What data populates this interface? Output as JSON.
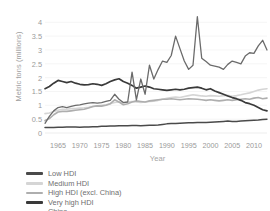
{
  "chart_data": {
    "type": "line",
    "title": "",
    "xlabel": "Year",
    "ylabel": "Metric tons (millions)",
    "xlim": [
      1962,
      2013
    ],
    "ylim": [
      0,
      4.3
    ],
    "ytick_labels": [
      "4",
      "3.5",
      "3",
      "2.5",
      "2",
      "1.5",
      "1",
      "0.5",
      "0"
    ],
    "ytick_values": [
      4,
      3.5,
      3,
      2.5,
      2,
      1.5,
      1,
      0.5,
      0
    ],
    "xtick_labels": [
      "1965",
      "1970",
      "1975",
      "1980",
      "1985",
      "1990",
      "1995",
      "2000",
      "2005",
      "2010"
    ],
    "xtick_values": [
      1965,
      1970,
      1975,
      1980,
      1985,
      1990,
      1995,
      2000,
      2005,
      2010
    ],
    "grid": true,
    "legend_position": "bottom-left",
    "x": [
      1962,
      1963,
      1964,
      1965,
      1966,
      1967,
      1968,
      1969,
      1970,
      1971,
      1972,
      1973,
      1974,
      1975,
      1976,
      1977,
      1978,
      1979,
      1980,
      1981,
      1982,
      1983,
      1984,
      1985,
      1986,
      1987,
      1988,
      1989,
      1990,
      1991,
      1992,
      1993,
      1994,
      1995,
      1996,
      1997,
      1998,
      1999,
      2000,
      2001,
      2002,
      2003,
      2004,
      2005,
      2006,
      2007,
      2008,
      2009,
      2010,
      2011,
      2012,
      2013
    ],
    "series": [
      {
        "name": "Low HDI",
        "color": "#4a4a4a",
        "width": 1.5,
        "values": [
          0.2,
          0.2,
          0.2,
          0.21,
          0.21,
          0.22,
          0.22,
          0.22,
          0.21,
          0.22,
          0.22,
          0.23,
          0.23,
          0.24,
          0.24,
          0.25,
          0.25,
          0.26,
          0.26,
          0.26,
          0.27,
          0.27,
          0.26,
          0.27,
          0.28,
          0.28,
          0.29,
          0.31,
          0.33,
          0.34,
          0.34,
          0.35,
          0.36,
          0.37,
          0.37,
          0.38,
          0.38,
          0.38,
          0.39,
          0.4,
          0.41,
          0.42,
          0.43,
          0.42,
          0.42,
          0.43,
          0.44,
          0.45,
          0.46,
          0.47,
          0.49,
          0.5
        ]
      },
      {
        "name": "Medium HDI",
        "color": "#d5d5d5",
        "width": 1.6,
        "values": [
          0.7,
          0.72,
          0.78,
          0.82,
          0.86,
          0.86,
          0.88,
          0.88,
          0.9,
          0.91,
          0.93,
          0.96,
          0.98,
          1.0,
          1.02,
          1.06,
          1.1,
          1.12,
          1.1,
          1.12,
          1.14,
          1.12,
          1.1,
          1.12,
          1.14,
          1.15,
          1.18,
          1.22,
          1.25,
          1.28,
          1.3,
          1.28,
          1.32,
          1.35,
          1.38,
          1.36,
          1.34,
          1.33,
          1.35,
          1.34,
          1.33,
          1.35,
          1.36,
          1.33,
          1.35,
          1.38,
          1.42,
          1.45,
          1.5,
          1.55,
          1.58,
          1.6
        ]
      },
      {
        "name": "High HDI (excl. China)",
        "color": "#aeaeae",
        "width": 1.6,
        "values": [
          0.45,
          0.52,
          0.66,
          0.76,
          0.78,
          0.78,
          0.8,
          0.82,
          0.84,
          0.86,
          0.9,
          0.96,
          0.98,
          0.97,
          1.0,
          1.06,
          1.2,
          1.12,
          1.02,
          1.06,
          1.12,
          1.16,
          1.14,
          1.12,
          1.16,
          1.18,
          1.2,
          1.22,
          1.22,
          1.24,
          1.22,
          1.2,
          1.22,
          1.24,
          1.23,
          1.22,
          1.2,
          1.18,
          1.2,
          1.18,
          1.16,
          1.18,
          1.2,
          1.18,
          1.2,
          1.22,
          1.24,
          1.22,
          1.26,
          1.28,
          1.24,
          1.26
        ]
      },
      {
        "name": "Very high HDI",
        "color": "#3a3a3a",
        "width": 1.7,
        "values": [
          1.6,
          1.68,
          1.8,
          1.9,
          1.86,
          1.82,
          1.86,
          1.8,
          1.76,
          1.74,
          1.75,
          1.78,
          1.76,
          1.72,
          1.78,
          1.86,
          1.92,
          1.96,
          1.86,
          1.8,
          1.72,
          1.62,
          1.66,
          1.7,
          1.66,
          1.6,
          1.58,
          1.56,
          1.54,
          1.56,
          1.58,
          1.56,
          1.58,
          1.62,
          1.64,
          1.66,
          1.62,
          1.56,
          1.6,
          1.52,
          1.46,
          1.4,
          1.34,
          1.28,
          1.24,
          1.18,
          1.1,
          1.06,
          1.0,
          0.92,
          0.84,
          0.8
        ]
      },
      {
        "name": "China",
        "color": "#6b6b6b",
        "width": 1.3,
        "values": [
          0.35,
          0.6,
          0.8,
          0.92,
          0.95,
          0.92,
          0.96,
          1.0,
          1.02,
          1.05,
          1.08,
          1.1,
          1.08,
          1.1,
          1.14,
          1.18,
          1.4,
          1.22,
          1.1,
          1.12,
          2.2,
          1.2,
          1.95,
          1.4,
          2.45,
          1.95,
          2.3,
          2.6,
          2.55,
          2.8,
          3.5,
          3.05,
          2.6,
          2.3,
          2.45,
          4.2,
          2.7,
          2.58,
          2.45,
          2.42,
          2.38,
          2.3,
          2.48,
          2.6,
          2.55,
          2.5,
          2.78,
          2.9,
          2.88,
          3.15,
          3.35,
          3.0
        ]
      }
    ]
  },
  "legend": {
    "items": [
      {
        "label": "Low HDI",
        "color": "#4a4a4a",
        "thickness": "3px"
      },
      {
        "label": "Medium HDI",
        "color": "#d5d5d5",
        "thickness": "2.6px"
      },
      {
        "label": "High HDI (excl. China)",
        "color": "#aeaeae",
        "thickness": "2.6px"
      },
      {
        "label": "Very high HDI",
        "color": "#3a3a3a",
        "thickness": "3.2px"
      },
      {
        "label": "China",
        "color": "#c9c9c9",
        "thickness": "2.6px"
      }
    ]
  }
}
